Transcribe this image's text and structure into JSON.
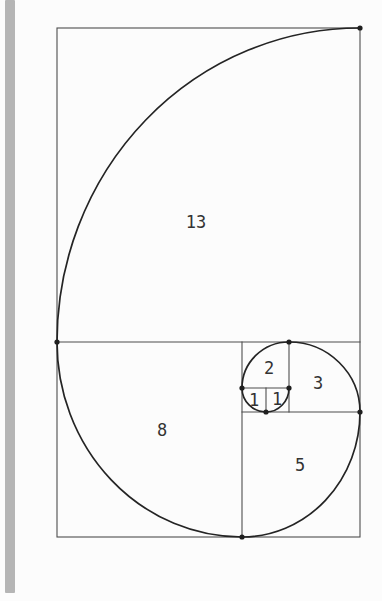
{
  "diagram": {
    "kind": "fibonacci-golden-spiral",
    "labels": {
      "square13": "13",
      "square8": "8",
      "square5": "5",
      "square3": "3",
      "square2": "2",
      "square1_left": "1",
      "square1_right": "1"
    },
    "colors": {
      "background": "#fcfcfc",
      "margin_bar": "#b5b5b5",
      "grid_line": "#4d4d4d",
      "spiral_line": "#242424",
      "dot": "#1f1f1f",
      "label_text": "#333333"
    }
  }
}
